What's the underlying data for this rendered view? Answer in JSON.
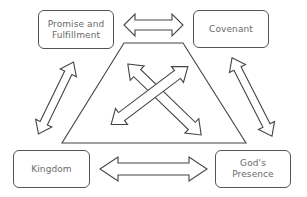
{
  "diagram": {
    "type": "relationship-diagram",
    "center_shape": "trapezoid",
    "nodes": [
      {
        "id": "promise",
        "label": "Promise and\nFulfillment",
        "position": "top-left"
      },
      {
        "id": "covenant",
        "label": "Covenant",
        "position": "top-right"
      },
      {
        "id": "kingdom",
        "label": "Kingdom",
        "position": "bottom-left"
      },
      {
        "id": "presence",
        "label": "God's\nPresence",
        "position": "bottom-right"
      }
    ],
    "edges": [
      {
        "from": "promise",
        "to": "covenant",
        "style": "double-arrow"
      },
      {
        "from": "kingdom",
        "to": "presence",
        "style": "double-arrow"
      },
      {
        "from": "promise",
        "to": "kingdom",
        "style": "double-arrow"
      },
      {
        "from": "covenant",
        "to": "presence",
        "style": "double-arrow"
      },
      {
        "from": "promise",
        "to": "presence",
        "style": "double-arrow",
        "via": "center"
      },
      {
        "from": "covenant",
        "to": "kingdom",
        "style": "double-arrow",
        "via": "center"
      }
    ],
    "colors": {
      "stroke": "#444444",
      "text": "#6a6a6a",
      "background": "#ffffff"
    }
  }
}
